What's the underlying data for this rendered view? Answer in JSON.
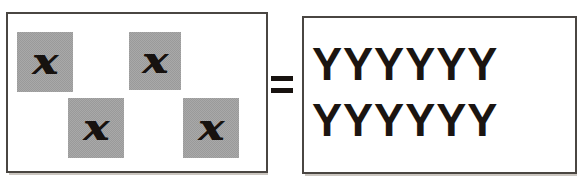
{
  "diagram": {
    "type": "algebraic-equivalence",
    "relation_symbol": "=",
    "left_side": {
      "label": "four variable tiles",
      "tile_count": 4,
      "tile_symbol": "x",
      "tile_fill_color": "#a9a9a9",
      "tiles": [
        {
          "id": "tile-1",
          "symbol": "x"
        },
        {
          "id": "tile-2",
          "symbol": "x"
        },
        {
          "id": "tile-3",
          "symbol": "x"
        },
        {
          "id": "tile-4",
          "symbol": "x"
        }
      ]
    },
    "right_side": {
      "label": "twelve Y units",
      "unit_symbol": "Y",
      "unit_count": 12,
      "rows": [
        {
          "text": "YYYYYY",
          "count": 6
        },
        {
          "text": "YYYYYY",
          "count": 6
        }
      ]
    },
    "colors": {
      "border": "#4a4642",
      "ink": "#17120f",
      "background": "#ffffff",
      "tile_gray": "#a9a9a9"
    }
  }
}
